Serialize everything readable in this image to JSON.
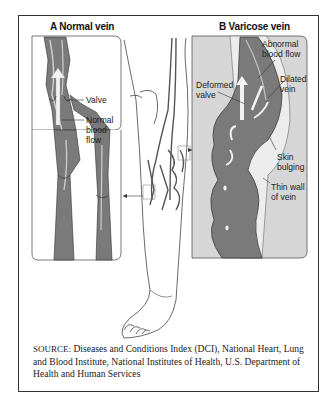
{
  "figure": {
    "panel_a": {
      "title": "A Normal vein",
      "labels": {
        "valve": "Valve",
        "flow_1": "Normal",
        "flow_2": "blood",
        "flow_3": "flow"
      }
    },
    "panel_b": {
      "title": "B Varicose vein",
      "labels": {
        "abnormal_1": "Abnormal",
        "abnormal_2": "blood flow",
        "dilated_1": "Dilated",
        "dilated_2": "vein",
        "deformed_1": "Deformed",
        "deformed_2": "valve",
        "skin_1": "Skin",
        "skin_2": "bulging",
        "wall_1": "Thin wall",
        "wall_2": "of vein"
      }
    },
    "source": {
      "prefix": "SOURCE:",
      "text": " Diseases and Conditions Index (DCI), National Heart, Lung and Blood Institute, National Institutes of Health, U.S. Department of Health and Human Services"
    },
    "colors": {
      "vein_fill": "#7a7a7a",
      "vein_light": "#c9c9c9",
      "panel_bg_b": "#d6d6d6",
      "flow_arrow": "#f2f2f2",
      "outline": "#333333"
    }
  }
}
